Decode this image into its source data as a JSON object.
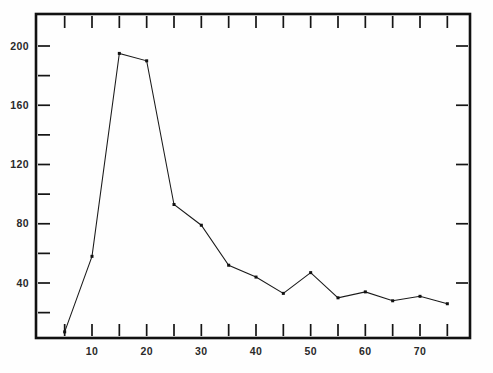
{
  "chart_data": {
    "type": "line",
    "title": "",
    "subtitle": "",
    "xlabel": "",
    "ylabel": "",
    "xlim": [
      0,
      78
    ],
    "ylim": [
      0,
      215
    ],
    "grid": false,
    "legend": "none",
    "x": [
      5,
      10,
      15,
      20,
      25,
      30,
      35,
      40,
      45,
      50,
      55,
      60,
      65,
      70,
      75
    ],
    "values": [
      7,
      58,
      195,
      190,
      93,
      79,
      52,
      44,
      33,
      47,
      30,
      34,
      28,
      31,
      26
    ],
    "series": [
      {
        "name": "series-1",
        "x": [
          5,
          10,
          15,
          20,
          25,
          30,
          35,
          40,
          45,
          50,
          55,
          60,
          65,
          70,
          75
        ],
        "values": [
          7,
          58,
          195,
          190,
          93,
          79,
          52,
          44,
          33,
          47,
          30,
          34,
          28,
          31,
          26
        ],
        "marker": "dot",
        "color": "#111111"
      }
    ],
    "x_ticks_major": [
      10,
      20,
      30,
      40,
      50,
      60,
      70
    ],
    "x_ticks_minor": [
      5,
      15,
      25,
      35,
      45,
      55,
      65,
      75
    ],
    "x_tick_labels": [
      "10",
      "20",
      "30",
      "40",
      "50",
      "60",
      "70"
    ],
    "y_ticks_major": [
      40,
      80,
      120,
      160,
      200
    ],
    "y_ticks_minor": [
      20,
      60,
      100,
      140,
      180
    ],
    "y_tick_labels": [
      "40",
      "80",
      "120",
      "160",
      "200"
    ],
    "annotations": []
  },
  "figure": {
    "background_color": "#ffffff",
    "frame_color": "#111111",
    "line_color": "#111111"
  }
}
